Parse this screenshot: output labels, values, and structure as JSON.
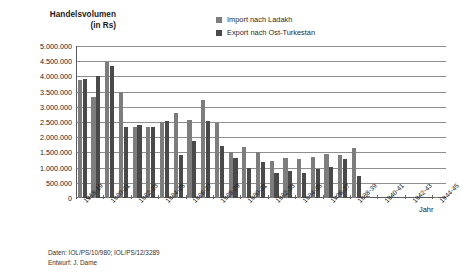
{
  "title": {
    "line1": "Handelsvolumen",
    "line2": "(in Rs)"
  },
  "legend": {
    "items": [
      {
        "label": "Import nach Ladakh",
        "color": "#7d7d7d",
        "key": "import"
      },
      {
        "label": "Export nach Ost-Turkestan",
        "color": "#4a4a4a",
        "key": "export"
      }
    ]
  },
  "axis": {
    "x_title": "Jahr",
    "y_ticklabels": [
      "5.000.000",
      "4.500.000",
      "4.000.000",
      "3.500.000",
      "3.000.000",
      "2.500.000",
      "2.000.000",
      "1.500.000",
      "1.000.000",
      "500.000",
      "0"
    ]
  },
  "footer": {
    "line1": "Daten: IOL/PS/10/980; IOL/PS/12/3289",
    "line2": "Entwurf: J. Dame"
  },
  "chart_data": {
    "type": "bar",
    "title": "Handelsvolumen (in Rs)",
    "xlabel": "Jahr",
    "ylabel": "Handelsvolumen (in Rs)",
    "ylim": [
      0,
      5000000
    ],
    "ytick_step": 500000,
    "grid": true,
    "legend_position": "top-right",
    "categories": [
      "1918-19",
      "1919-20",
      "1920-21",
      "1921-22",
      "1922-23",
      "1923-24",
      "1924-25",
      "1925-26",
      "1926-27",
      "1927-28",
      "1928-29",
      "1929-30",
      "1930-31",
      "1931-32",
      "1932-33",
      "1933-34",
      "1934-35",
      "1935-36",
      "1936-37",
      "1937-38",
      "1938-39",
      "1939-40",
      "1940-41",
      "1941-42",
      "1942-43",
      "1943-44",
      "1944-45"
    ],
    "xtick_labels": [
      "1918-19",
      "1920-21",
      "1922-23",
      "1924-25",
      "1926-27",
      "1928-29",
      "1930-31",
      "1932-33",
      "1934-35",
      "1936-37",
      "1938-39",
      "1940-41",
      "1942-43",
      "1944-45"
    ],
    "series": [
      {
        "name": "Import nach Ladakh",
        "color": "#7d7d7d",
        "values": [
          3880000,
          3310000,
          4470000,
          3500000,
          2330000,
          2350000,
          2490000,
          2790000,
          2580000,
          3210000,
          2470000,
          1500000,
          1680000,
          1530000,
          1230000,
          1320000,
          1290000,
          1360000,
          1450000,
          1410000,
          1640000,
          60000,
          0,
          0,
          0,
          0,
          40000
        ]
      },
      {
        "name": "Export nach Ost-Turkestan",
        "color": "#4a4a4a",
        "values": [
          3930000,
          4000000,
          4350000,
          2320000,
          2400000,
          2330000,
          2540000,
          1430000,
          1890000,
          2520000,
          1700000,
          1320000,
          1000000,
          1180000,
          830000,
          880000,
          820000,
          950000,
          1020000,
          1270000,
          740000,
          0,
          0,
          0,
          0,
          0,
          0
        ]
      }
    ]
  }
}
